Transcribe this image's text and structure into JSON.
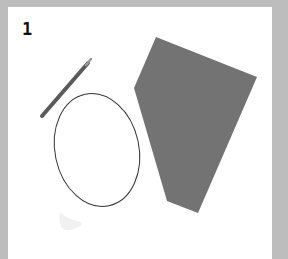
{
  "card": {
    "number_label": "1"
  },
  "colors": {
    "background": "#bdbdbd",
    "card": "#ffffff",
    "polygon_fill": "#737373",
    "ellipse_stroke": "#333333",
    "pencil": "#5a5a5a"
  },
  "items": [
    {
      "type": "pencil",
      "name": "pencil"
    },
    {
      "type": "ellipse",
      "name": "ellipse-outline"
    },
    {
      "type": "polygon",
      "name": "gray-quadrilateral"
    },
    {
      "type": "smudge",
      "name": "faint-smudge"
    }
  ]
}
